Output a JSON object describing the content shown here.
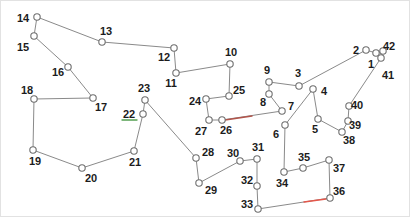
{
  "diagram": {
    "type": "node-link-tour-graph",
    "background_color": "#ffffff",
    "styles": {
      "edge_color": "#8a8a8a",
      "edge_width": 1,
      "node_fill": "#ffffff",
      "node_stroke": "#6f6f6f",
      "node_stroke_width": 1.1,
      "node_radius": 3.2,
      "label_color": "#1c1c1c",
      "label_font_size": 11,
      "highlight_red": "#d9544a",
      "highlight_green": "#54a052"
    },
    "nodes": [
      {
        "id": "1",
        "x": 375,
        "y": 52,
        "lx": 370,
        "ly": 63
      },
      {
        "id": "2",
        "x": 365,
        "y": 49,
        "lx": 355,
        "ly": 49
      },
      {
        "id": "3",
        "x": 298,
        "y": 85,
        "lx": 297,
        "ly": 72
      },
      {
        "id": "4",
        "x": 312,
        "y": 88,
        "lx": 323,
        "ly": 90
      },
      {
        "id": "5",
        "x": 317,
        "y": 118,
        "lx": 314,
        "ly": 128
      },
      {
        "id": "6",
        "x": 284,
        "y": 124,
        "lx": 275,
        "ly": 133
      },
      {
        "id": "7",
        "x": 281,
        "y": 110,
        "lx": 290,
        "ly": 105
      },
      {
        "id": "8",
        "x": 268,
        "y": 93,
        "lx": 262,
        "ly": 101
      },
      {
        "id": "9",
        "x": 268,
        "y": 81,
        "lx": 266,
        "ly": 69
      },
      {
        "id": "10",
        "x": 229,
        "y": 63,
        "lx": 230,
        "ly": 51
      },
      {
        "id": "11",
        "x": 175,
        "y": 72,
        "lx": 170,
        "ly": 82
      },
      {
        "id": "12",
        "x": 173,
        "y": 47,
        "lx": 163,
        "ly": 56
      },
      {
        "id": "13",
        "x": 101,
        "y": 41,
        "lx": 105,
        "ly": 30
      },
      {
        "id": "14",
        "x": 36,
        "y": 16,
        "lx": 22,
        "ly": 17
      },
      {
        "id": "15",
        "x": 33,
        "y": 35,
        "lx": 22,
        "ly": 46
      },
      {
        "id": "16",
        "x": 67,
        "y": 66,
        "lx": 57,
        "ly": 71
      },
      {
        "id": "17",
        "x": 92,
        "y": 97,
        "lx": 100,
        "ly": 106
      },
      {
        "id": "18",
        "x": 33,
        "y": 98,
        "lx": 26,
        "ly": 89
      },
      {
        "id": "19",
        "x": 32,
        "y": 149,
        "lx": 34,
        "ly": 160
      },
      {
        "id": "20",
        "x": 81,
        "y": 167,
        "lx": 90,
        "ly": 177
      },
      {
        "id": "21",
        "x": 133,
        "y": 150,
        "lx": 134,
        "ly": 161
      },
      {
        "id": "22",
        "x": 142,
        "y": 113,
        "lx": 128,
        "ly": 113
      },
      {
        "id": "23",
        "x": 144,
        "y": 99,
        "lx": 143,
        "ly": 87
      },
      {
        "id": "24",
        "x": 205,
        "y": 98,
        "lx": 194,
        "ly": 100
      },
      {
        "id": "25",
        "x": 228,
        "y": 95,
        "lx": 238,
        "ly": 89
      },
      {
        "id": "26",
        "x": 221,
        "y": 119,
        "lx": 225,
        "ly": 129
      },
      {
        "id": "27",
        "x": 208,
        "y": 119,
        "lx": 200,
        "ly": 130
      },
      {
        "id": "28",
        "x": 195,
        "y": 157,
        "lx": 207,
        "ly": 151
      },
      {
        "id": "29",
        "x": 198,
        "y": 182,
        "lx": 210,
        "ly": 189
      },
      {
        "id": "30",
        "x": 239,
        "y": 160,
        "lx": 232,
        "ly": 152
      },
      {
        "id": "31",
        "x": 256,
        "y": 158,
        "lx": 257,
        "ly": 146
      },
      {
        "id": "32",
        "x": 256,
        "y": 185,
        "lx": 246,
        "ly": 179
      },
      {
        "id": "33",
        "x": 257,
        "y": 208,
        "lx": 246,
        "ly": 203
      },
      {
        "id": "34",
        "x": 283,
        "y": 171,
        "lx": 281,
        "ly": 182
      },
      {
        "id": "35",
        "x": 302,
        "y": 167,
        "lx": 303,
        "ly": 156
      },
      {
        "id": "36",
        "x": 329,
        "y": 197,
        "lx": 338,
        "ly": 190
      },
      {
        "id": "37",
        "x": 328,
        "y": 159,
        "lx": 338,
        "ly": 167
      },
      {
        "id": "38",
        "x": 341,
        "y": 131,
        "lx": 348,
        "ly": 139
      },
      {
        "id": "39",
        "x": 347,
        "y": 120,
        "lx": 354,
        "ly": 124
      },
      {
        "id": "40",
        "x": 348,
        "y": 105,
        "lx": 356,
        "ly": 104
      },
      {
        "id": "41",
        "x": 380,
        "y": 57,
        "lx": 387,
        "ly": 74
      },
      {
        "id": "42",
        "x": 382,
        "y": 50,
        "lx": 388,
        "ly": 45
      }
    ],
    "edges": [
      {
        "from": "1",
        "to": "2"
      },
      {
        "from": "2",
        "to": "3"
      },
      {
        "from": "3",
        "to": "9"
      },
      {
        "from": "9",
        "to": "8"
      },
      {
        "from": "8",
        "to": "7"
      },
      {
        "from": "7",
        "to": "26"
      },
      {
        "from": "26",
        "to": "27"
      },
      {
        "from": "27",
        "to": "24"
      },
      {
        "from": "24",
        "to": "25"
      },
      {
        "from": "25",
        "to": "10"
      },
      {
        "from": "10",
        "to": "11"
      },
      {
        "from": "11",
        "to": "12"
      },
      {
        "from": "12",
        "to": "13"
      },
      {
        "from": "13",
        "to": "14"
      },
      {
        "from": "14",
        "to": "15"
      },
      {
        "from": "15",
        "to": "16"
      },
      {
        "from": "16",
        "to": "17"
      },
      {
        "from": "17",
        "to": "18"
      },
      {
        "from": "18",
        "to": "19"
      },
      {
        "from": "19",
        "to": "20"
      },
      {
        "from": "20",
        "to": "21"
      },
      {
        "from": "21",
        "to": "22"
      },
      {
        "from": "22",
        "to": "23"
      },
      {
        "from": "23",
        "to": "28"
      },
      {
        "from": "28",
        "to": "29"
      },
      {
        "from": "29",
        "to": "30"
      },
      {
        "from": "30",
        "to": "31"
      },
      {
        "from": "31",
        "to": "32"
      },
      {
        "from": "32",
        "to": "33"
      },
      {
        "from": "33",
        "to": "36"
      },
      {
        "from": "36",
        "to": "37"
      },
      {
        "from": "37",
        "to": "35"
      },
      {
        "from": "35",
        "to": "34"
      },
      {
        "from": "34",
        "to": "6"
      },
      {
        "from": "6",
        "to": "4"
      },
      {
        "from": "4",
        "to": "5"
      },
      {
        "from": "5",
        "to": "38"
      },
      {
        "from": "38",
        "to": "39"
      },
      {
        "from": "39",
        "to": "40"
      },
      {
        "from": "40",
        "to": "41"
      },
      {
        "from": "41",
        "to": "42"
      },
      {
        "from": "42",
        "to": "1"
      }
    ],
    "highlight_segments": [
      {
        "name": "red-segment-on-edge-26-7",
        "x1": 224,
        "y1": 119,
        "x2": 251,
        "y2": 115,
        "color": "#b2544a"
      },
      {
        "name": "red-segment-on-edge-33-36",
        "x1": 303,
        "y1": 201,
        "x2": 325,
        "y2": 198,
        "color": "#e4574b"
      },
      {
        "name": "green-mark-under-label-22",
        "x1": 121,
        "y1": 119,
        "x2": 136,
        "y2": 119,
        "color": "#54a052"
      }
    ]
  }
}
